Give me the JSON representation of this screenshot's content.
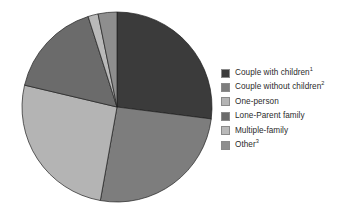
{
  "chart_data": {
    "type": "pie",
    "title": "",
    "subtitle": "",
    "xlabel": "",
    "ylabel": "",
    "grid": false,
    "legend_position": "right",
    "start_angle_deg": 0,
    "direction": "clockwise",
    "center": {
      "cx": 117,
      "cy": 107,
      "r": 95
    },
    "categories": [
      "Couple with children",
      "Couple without children",
      "One-person",
      "Lone-Parent family",
      "Multiple-family",
      "Other"
    ],
    "values": [
      27.0,
      25.8,
      25.9,
      16.4,
      1.7,
      3.2
    ],
    "colors": [
      "#3b3b3b",
      "#7d7d7d",
      "#b4b4b4",
      "#6b6b6b",
      "#b9b9b9",
      "#8e8e8e"
    ],
    "slices": [
      {
        "label": "Couple with children",
        "footnote": "1",
        "value": 27.0,
        "color": "#3b3b3b",
        "start_deg": 0.0,
        "end_deg": 97.2
      },
      {
        "label": "Couple without children",
        "footnote": "2",
        "value": 25.8,
        "color": "#7d7d7d",
        "start_deg": 97.2,
        "end_deg": 190.1
      },
      {
        "label": "One-person",
        "footnote": "",
        "value": 25.9,
        "color": "#b4b4b4",
        "start_deg": 190.1,
        "end_deg": 283.3
      },
      {
        "label": "Lone-Parent family",
        "footnote": "",
        "value": 16.4,
        "color": "#6b6b6b",
        "start_deg": 283.3,
        "end_deg": 342.3
      },
      {
        "label": "Multiple-family",
        "footnote": "",
        "value": 1.7,
        "color": "#b9b9b9",
        "start_deg": 342.3,
        "end_deg": 348.5
      },
      {
        "label": "Other",
        "footnote": "3",
        "value": 3.2,
        "color": "#8e8e8e",
        "start_deg": 348.5,
        "end_deg": 360.0
      }
    ],
    "slice_edge_color": "#1f1f1f",
    "slice_edge_width": 0.7
  },
  "legend": {
    "items": [
      {
        "label": "Couple with children",
        "footnote": "1",
        "color": "#3b3b3b"
      },
      {
        "label": "Couple without children",
        "footnote": "2",
        "color": "#7d7d7d"
      },
      {
        "label": "One-person",
        "footnote": "",
        "color": "#b4b4b4"
      },
      {
        "label": "Lone-Parent family",
        "footnote": "",
        "color": "#6b6b6b"
      },
      {
        "label": "Multiple-family",
        "footnote": "",
        "color": "#b9b9b9"
      },
      {
        "label": "Other",
        "footnote": "3",
        "color": "#8e8e8e"
      }
    ]
  }
}
